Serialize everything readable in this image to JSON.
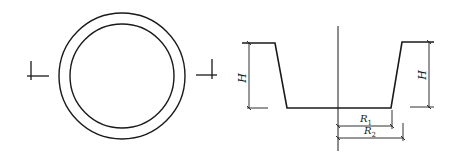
{
  "figure": {
    "left_view": {
      "description": "plan view of ring with section marks",
      "outer_circle": {
        "cx": 122,
        "cy": 76,
        "r": 63
      },
      "inner_circle": {
        "cx": 122,
        "cy": 76,
        "r": 52
      },
      "section_marks": [
        "left",
        "right"
      ]
    },
    "right_view": {
      "description": "cross-section profile of trapezoidal trough",
      "labels": {
        "height_left": "H",
        "height_right": "H",
        "r1_main": "R",
        "r1_sub": "1",
        "r2_main": "R",
        "r2_sub": "2"
      }
    },
    "stroke_color": "#1a1a1a",
    "background_color": "#ffffff"
  }
}
